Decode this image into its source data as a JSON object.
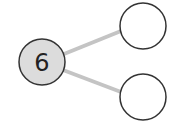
{
  "diagram": {
    "type": "number-bond",
    "whole": {
      "value": "6",
      "fill": "#dcdcdc",
      "stroke": "#333333"
    },
    "parts": [
      {
        "value": "",
        "fill": "#ffffff",
        "stroke": "#333333"
      },
      {
        "value": "",
        "fill": "#ffffff",
        "stroke": "#333333"
      }
    ],
    "connector_color": "#c4c4c4"
  }
}
